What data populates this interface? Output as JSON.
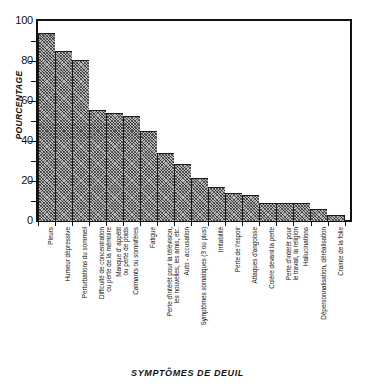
{
  "chart_data": {
    "type": "bar",
    "title": "",
    "xlabel": "SYMPTÔMES DE DEUIL",
    "ylabel": "POURCENTAGE",
    "ylim": [
      0,
      100
    ],
    "ytick_labels": [
      "0",
      "20",
      "40",
      "60",
      "80",
      "100"
    ],
    "ytick_values": [
      0,
      20,
      40,
      60,
      80,
      100
    ],
    "yminor_values": [
      10,
      30,
      50,
      70,
      90
    ],
    "grid": false,
    "legend": "none",
    "categories": [
      "Pleurs",
      "Humeur dépressive",
      "Perturbations du sommeil",
      "Difficulté de concentration ou perte de la mémoire",
      "Manque d' appétit ou perte de poids",
      "Calmants ou somnifères",
      "Fatigue",
      "Perte d'intérêt pour la télévision, les nouvelles, les amis, etc.",
      "Auto - accusation",
      "Symptômes somatiques (3 ou plus)",
      "Irritabilité",
      "Perte de l'espoir",
      "Attaques d'angoisse",
      "Colère devant la perte",
      "Perte d'intérêt pour le travail, la religion",
      "Hallucinations",
      "Dépersonnalisation, déréalisation",
      "Crainte de la folie"
    ],
    "category_lines": [
      [
        "Pleurs"
      ],
      [
        "Humeur dépressive"
      ],
      [
        "Perturbations du sommeil"
      ],
      [
        "Difficulté de concentration",
        "ou perte de la mémoire"
      ],
      [
        "Manque d' appétit",
        "ou perte de poids"
      ],
      [
        "Calmants ou somnifères"
      ],
      [
        "Fatigue"
      ],
      [
        "Perte d'intérêt pour la télévision,",
        "les nouvelles, les amis, etc."
      ],
      [
        "Auto - accusation"
      ],
      [
        "Symptômes somatiques (3 ou plus)"
      ],
      [
        "Irritabilité"
      ],
      [
        "Perte de l'espoir"
      ],
      [
        "Attaques d'angoisse"
      ],
      [
        "Colère devant la perte"
      ],
      [
        "Perte d'intérêt pour",
        "le travail, la religion"
      ],
      [
        "Hallucinations"
      ],
      [
        "Dépersonnalisation, déréalisation"
      ],
      [
        "Crainte de la folie"
      ]
    ],
    "values": [
      94,
      85,
      80.5,
      55.5,
      54,
      52.5,
      45,
      34,
      28.5,
      21.5,
      17,
      14,
      13,
      9,
      9,
      9,
      6,
      3
    ]
  },
  "colors": {
    "bar_fill": "#b9b9b9",
    "bar_edge": "#1a1a1a",
    "axis": "#111111",
    "background": "#ffffff"
  }
}
